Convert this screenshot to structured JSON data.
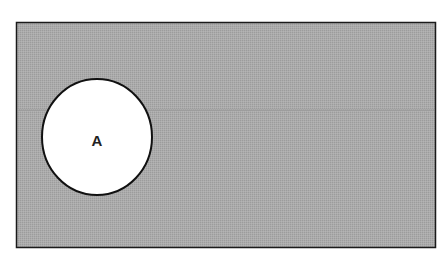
{
  "diagram": {
    "type": "venn",
    "universal_set": {
      "shaded": true,
      "fill_color": "#a8a8a8",
      "border_color": "#1a1a1a"
    },
    "sets": [
      {
        "label": "A",
        "shaded": false,
        "fill_color": "#ffffff",
        "border_color": "#111111"
      }
    ]
  }
}
